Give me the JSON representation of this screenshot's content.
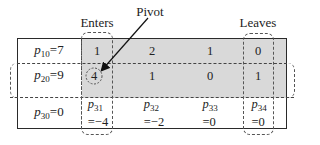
{
  "annotations": {
    "enters_label": "Enters",
    "leaves_label": "Leaves",
    "pivot_label": "Pivot"
  },
  "rows": [
    {
      "label_var": "p",
      "label_sub": "10",
      "label_eq": "=7",
      "cells": [
        "1",
        "2",
        "1",
        "0"
      ],
      "shaded": true
    },
    {
      "label_var": "p",
      "label_sub": "20",
      "label_eq": "=9",
      "cells": [
        "4",
        "1",
        "0",
        "1"
      ],
      "shaded": true,
      "highlighted_row": true
    },
    {
      "label_var": "p",
      "label_sub": "30",
      "label_eq": "=0",
      "cells": [
        {
          "var": "p",
          "sub": "31",
          "value": "=−4"
        },
        {
          "var": "p",
          "sub": "32",
          "value": "=−2"
        },
        {
          "var": "p",
          "sub": "33",
          "value": "=0"
        },
        {
          "var": "p",
          "sub": "34",
          "value": "=0"
        }
      ],
      "shaded": false
    }
  ],
  "pivot": {
    "row": 2,
    "col": 1,
    "value": "4"
  },
  "entering_column": 1,
  "leaving_column": 4,
  "colors": {
    "shade": "#d9d9d9",
    "line": "#2a2a2a",
    "dash": "#555555"
  }
}
